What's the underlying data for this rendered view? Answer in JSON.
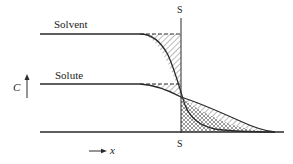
{
  "diagram": {
    "labels": {
      "solvent": "Solvent",
      "solute": "Solute",
      "interface_top": "S",
      "interface_bottom": "S",
      "y_axis": "C",
      "x_axis": "x"
    },
    "colors": {
      "line": "#2a2a2a",
      "hatch": "#555555",
      "background": "#ffffff"
    },
    "curves": [
      {
        "name": "solvent",
        "plateau_y": 34,
        "profile": "sigmoid-drop to interface"
      },
      {
        "name": "solute",
        "plateau_y": 84,
        "profile": "sigmoid-drop extending to baseline"
      }
    ]
  }
}
